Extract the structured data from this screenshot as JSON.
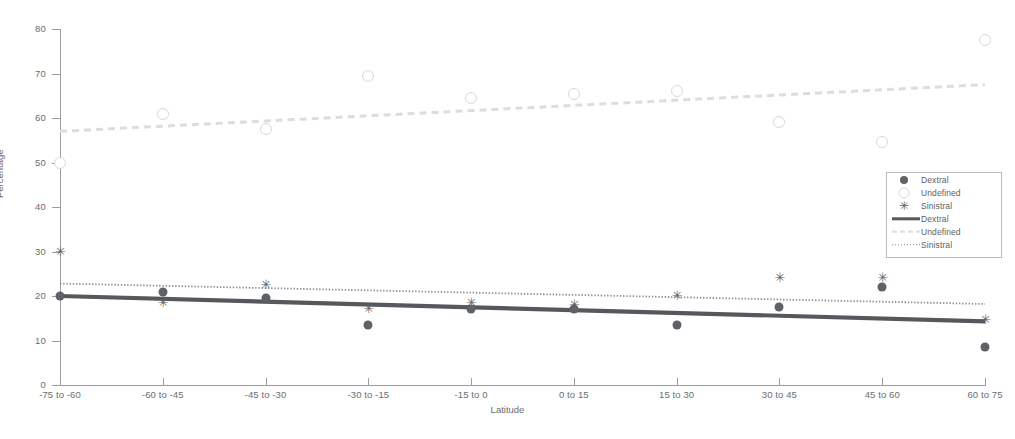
{
  "chart_data": {
    "type": "scatter",
    "title": "",
    "xlabel": "Latitude",
    "ylabel": "Percentage",
    "ylim": [
      0,
      80
    ],
    "yticks": [
      0,
      10,
      20,
      30,
      40,
      50,
      60,
      70,
      80
    ],
    "grid": false,
    "legend_position": "right",
    "categories": [
      "-75 to -60",
      "-60 to -45",
      "-45 to -30",
      "-30 to -15",
      "-15 to 0",
      "0 to 15",
      "15 to 30",
      "30 to 45",
      "45 to 60",
      "60 to 75"
    ],
    "series": [
      {
        "name": "Dextral",
        "marker": "filled-circle",
        "color": "#5e6267",
        "values": [
          20.0,
          21.0,
          19.5,
          13.5,
          17.0,
          17.0,
          13.5,
          17.5,
          22.0,
          8.5
        ]
      },
      {
        "name": "Undefined",
        "marker": "open-circle",
        "color": "#d8d9db",
        "values": [
          50.0,
          61.0,
          57.5,
          69.5,
          64.5,
          65.5,
          66.0,
          59.0,
          54.5,
          77.5
        ]
      },
      {
        "name": "Sinistral",
        "marker": "asterisk",
        "color": "#5e6267",
        "values": [
          30.0,
          18.5,
          22.5,
          17.0,
          18.5,
          18.0,
          20.0,
          24.0,
          24.0,
          14.5
        ]
      }
    ],
    "trendlines": [
      {
        "name": "Dextral",
        "style": "solid",
        "color": "#55585c",
        "y_start": 20.0,
        "y_end": 14.3
      },
      {
        "name": "Undefined",
        "style": "dashed",
        "color": "#dcdddf",
        "y_start": 57.0,
        "y_end": 67.5
      },
      {
        "name": "Sinistral",
        "style": "dotted",
        "color": "#8d9094",
        "y_start": 22.8,
        "y_end": 18.2
      }
    ]
  },
  "legend": {
    "entries": [
      {
        "label": "Dextral",
        "symbol": "marker-filled-circle"
      },
      {
        "label": "Undefined",
        "symbol": "marker-open-circle"
      },
      {
        "label": "Sinistral",
        "symbol": "marker-asterisk"
      },
      {
        "label": "Dextral",
        "symbol": "line-solid"
      },
      {
        "label": "Undefined",
        "symbol": "line-dashed"
      },
      {
        "label": "Sinistral",
        "symbol": "line-dotted"
      }
    ]
  },
  "caption": {
    "text": ""
  }
}
